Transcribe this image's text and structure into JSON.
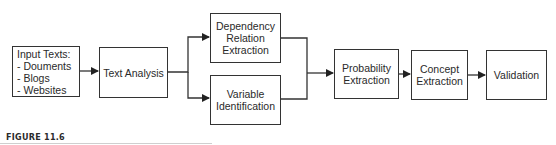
{
  "diagram": {
    "type": "flowchart",
    "direction": "left-to-right",
    "nodes": {
      "input": {
        "title": "Input Texts:",
        "items": [
          "-  Douments",
          "-  Blogs",
          "-  Websites"
        ]
      },
      "text_analysis": {
        "label": "Text Analysis"
      },
      "dependency": {
        "label": "Dependency\nRelation\nExtraction"
      },
      "variable": {
        "label": "Variable\nIdentification"
      },
      "probability": {
        "label": "Probability\nExtraction"
      },
      "concept": {
        "label": "Concept\nExtraction"
      },
      "validation": {
        "label": "Validation"
      }
    },
    "edges": [
      {
        "from": "input",
        "to": "text_analysis"
      },
      {
        "from": "text_analysis",
        "to": "dependency"
      },
      {
        "from": "text_analysis",
        "to": "variable"
      },
      {
        "from": "dependency",
        "to": "probability"
      },
      {
        "from": "variable",
        "to": "probability"
      },
      {
        "from": "probability",
        "to": "concept"
      },
      {
        "from": "concept",
        "to": "validation"
      }
    ],
    "colors": {
      "stroke": "#333333",
      "background": "#ffffff",
      "text": "#2a2a2a"
    }
  },
  "caption": {
    "label": "FIGURE 11.6"
  }
}
